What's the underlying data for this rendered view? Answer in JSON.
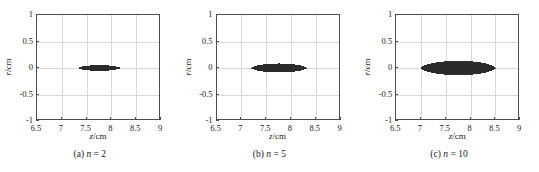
{
  "figure": {
    "background": "#ffffff",
    "axis_color": "#4d4d4d",
    "grid_color": "#d8d8d8",
    "data_color": "#2b2b2b"
  },
  "chart_data": [
    {
      "type": "area",
      "title": "",
      "panel_label": "(a)",
      "param_symbol": "n",
      "param_equals": "=",
      "param_value": "2",
      "caption": "(a) n = 2",
      "xlabel": "z/cm",
      "ylabel": "r/cm",
      "xlabel_var": "z",
      "xlabel_unit": "/cm",
      "ylabel_var": "r",
      "ylabel_unit": "/cm",
      "xlim": [
        6.5,
        9
      ],
      "ylim": [
        -1,
        1
      ],
      "xticks": [
        6.5,
        7,
        7.5,
        8,
        8.5,
        9
      ],
      "xticklabels": [
        "6.5",
        "7",
        "7.5",
        "8",
        "8.5",
        "9"
      ],
      "yticks": [
        -1,
        -0.5,
        0,
        0.5,
        1
      ],
      "yticklabels": [
        "-1",
        "-0.5",
        "0",
        "0.5",
        "1"
      ],
      "grid": true,
      "legend": "none",
      "region": {
        "shape": "lens",
        "x_start": 7.34,
        "x_end": 8.16,
        "x_center": 7.75,
        "half_length": 0.41,
        "half_width": 0.055,
        "y_center": 0
      }
    },
    {
      "type": "area",
      "title": "",
      "panel_label": "(b)",
      "param_symbol": "n",
      "param_equals": "=",
      "param_value": "5",
      "caption": "(b) n = 5",
      "xlabel": "z/cm",
      "ylabel": "r/cm",
      "xlabel_var": "z",
      "xlabel_unit": "/cm",
      "ylabel_var": "r",
      "ylabel_unit": "/cm",
      "xlim": [
        6.5,
        9
      ],
      "ylim": [
        -1,
        1
      ],
      "xticks": [
        6.5,
        7,
        7.5,
        8,
        8.5,
        9
      ],
      "xticklabels": [
        "6.5",
        "7",
        "7.5",
        "8",
        "8.5",
        "9"
      ],
      "yticks": [
        -1,
        -0.5,
        0,
        0.5,
        1
      ],
      "yticklabels": [
        "-1",
        "-0.5",
        "0",
        "0.5",
        "1"
      ],
      "grid": true,
      "legend": "none",
      "region": {
        "shape": "lens",
        "x_start": 7.2,
        "x_end": 8.3,
        "x_center": 7.75,
        "half_length": 0.55,
        "half_width": 0.085,
        "y_center": 0
      }
    },
    {
      "type": "area",
      "title": "",
      "panel_label": "(c)",
      "param_symbol": "n",
      "param_equals": "=",
      "param_value": "10",
      "caption": "(c) n = 10",
      "xlabel": "z/cm",
      "ylabel": "r/cm",
      "xlabel_var": "z",
      "xlabel_unit": "/cm",
      "ylabel_var": "r",
      "ylabel_unit": "/cm",
      "xlim": [
        6.5,
        9
      ],
      "ylim": [
        -1,
        1
      ],
      "xticks": [
        6.5,
        7,
        7.5,
        8,
        8.5,
        9
      ],
      "xticklabels": [
        "6.5",
        "7",
        "7.5",
        "8",
        "8.5",
        "9"
      ],
      "yticks": [
        -1,
        -0.5,
        0,
        0.5,
        1
      ],
      "yticklabels": [
        "-1",
        "-0.5",
        "0",
        "0.5",
        "1"
      ],
      "grid": true,
      "legend": "none",
      "region": {
        "shape": "lens",
        "x_start": 7.0,
        "x_end": 8.5,
        "x_center": 7.75,
        "half_length": 0.75,
        "half_width": 0.135,
        "y_center": 0
      }
    }
  ]
}
